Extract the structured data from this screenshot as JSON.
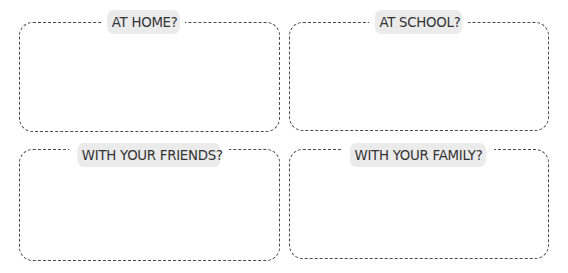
{
  "worksheet": {
    "colors": {
      "border": "#4a4a4a",
      "label_background": "#ebebeb",
      "label_text": "#333333",
      "page_background": "#ffffff"
    },
    "boxes": [
      {
        "label": "AT HOME?",
        "answer": ""
      },
      {
        "label": "AT SCHOOL?",
        "answer": ""
      },
      {
        "label": "WITH YOUR FRIENDS?",
        "answer": ""
      },
      {
        "label": "WITH YOUR FAMILY?",
        "answer": ""
      }
    ]
  }
}
